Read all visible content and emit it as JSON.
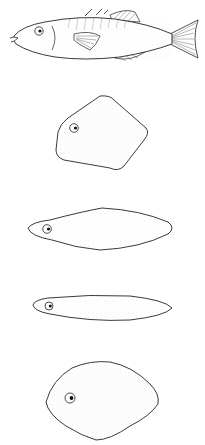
{
  "figure": {
    "shapes": [
      {
        "id": "fusiform-fish",
        "label": ""
      },
      {
        "id": "compressed-rhomboid",
        "label": ""
      },
      {
        "id": "fusiform-body",
        "label": ""
      },
      {
        "id": "elongate-body",
        "label": ""
      },
      {
        "id": "deep-body",
        "label": ""
      }
    ],
    "colors": {
      "outline": "#222222",
      "fill": "#ffffff",
      "stipple": "#9a9a9a",
      "background": "#ffffff"
    }
  }
}
